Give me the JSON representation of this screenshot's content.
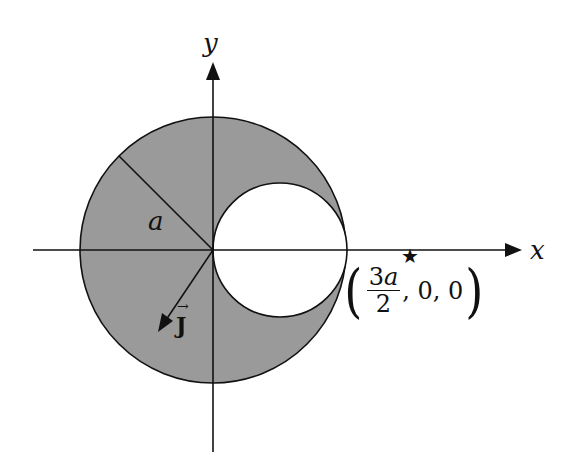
{
  "diagram": {
    "type": "geometry-figure",
    "colors": {
      "fill": "#9a9a9a",
      "stroke": "#111111",
      "hole": "#ffffff",
      "background": "#ffffff"
    },
    "axes": {
      "x_label": "x",
      "y_label": "y"
    },
    "large_circle": {
      "radius_label": "a"
    },
    "hole_circle": {
      "note": "radius a/2, centered at (a/2, 0)"
    },
    "vector": {
      "label": "J",
      "arrow": "→"
    },
    "point": {
      "marker": "★",
      "label_numerator": "3",
      "label_numerator_var": "a",
      "label_denominator": "2",
      "label_rest": ", 0, 0",
      "open_paren": "(",
      "close_paren": ")"
    }
  }
}
